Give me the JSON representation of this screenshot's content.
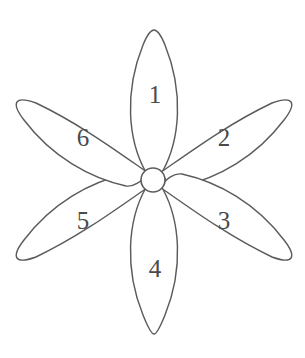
{
  "figure": {
    "background_color": "#ffffff",
    "stroke_color": "#5b5b5b",
    "label_color": "#4a4a4a",
    "width": 305,
    "height": 358
  },
  "flower": {
    "center": {
      "cx": 153,
      "cy": 180,
      "r": 12
    },
    "petal_count": 6,
    "petals": [
      {
        "label": "1",
        "position": "top",
        "angle_deg": 90,
        "label_x": 155,
        "label_y": 97,
        "tip_x": 154,
        "tip_y": 31
      },
      {
        "label": "2",
        "position": "upper-right",
        "angle_deg": 30,
        "label_x": 224,
        "label_y": 140,
        "tip_x": 278,
        "tip_y": 104
      },
      {
        "label": "3",
        "position": "lower-right",
        "angle_deg": -30,
        "label_x": 224,
        "label_y": 223,
        "tip_x": 278,
        "tip_y": 256
      },
      {
        "label": "4",
        "position": "bottom",
        "angle_deg": -90,
        "label_x": 155,
        "label_y": 271,
        "tip_x": 154,
        "tip_y": 334
      },
      {
        "label": "5",
        "position": "lower-left",
        "angle_deg": -150,
        "label_x": 83,
        "label_y": 223,
        "tip_x": 30,
        "tip_y": 256
      },
      {
        "label": "6",
        "position": "upper-left",
        "angle_deg": 150,
        "label_x": 83,
        "label_y": 140,
        "tip_x": 30,
        "tip_y": 104
      }
    ]
  }
}
